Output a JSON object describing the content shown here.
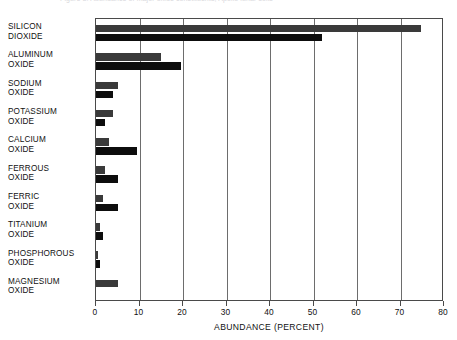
{
  "caption": {
    "text": "Figure 3. Abundance of major oxide constituents, Apollo lunar soils"
  },
  "chart_data": {
    "type": "bar",
    "orientation": "horizontal",
    "title": "",
    "xlabel": "ABUNDANCE (PERCENT)",
    "ylabel": "",
    "xlim": [
      0,
      80
    ],
    "xticks": [
      0,
      10,
      20,
      30,
      40,
      50,
      60,
      70,
      80
    ],
    "xtick_labels": [
      "0",
      "10",
      "20",
      "30",
      "40",
      "50",
      "60",
      "70",
      "80"
    ],
    "grid": true,
    "grid_axis": "x",
    "legend": "none",
    "categories": [
      "SILICON DIOXIDE",
      "ALUMINUM OXIDE",
      "SODIUM OXIDE",
      "POTASSIUM OXIDE",
      "CALCIUM OXIDE",
      "FERROUS OXIDE",
      "FERRIC OXIDE",
      "TITANIUM OXIDE",
      "PHOSPHOROUS OXIDE",
      "MAGNESIUM OXIDE"
    ],
    "category_lines": [
      [
        "SILICON",
        "DIOXIDE"
      ],
      [
        "ALUMINUM",
        "OXIDE"
      ],
      [
        "SODIUM",
        "OXIDE"
      ],
      [
        "POTASSIUM",
        "OXIDE"
      ],
      [
        "CALCIUM",
        "OXIDE"
      ],
      [
        "FERROUS",
        "OXIDE"
      ],
      [
        "FERRIC",
        "OXIDE"
      ],
      [
        "TITANIUM",
        "OXIDE"
      ],
      [
        "PHOSPHOROUS",
        "OXIDE"
      ],
      [
        "MAGNESIUM",
        "OXIDE"
      ]
    ],
    "series": [
      {
        "name": "upper",
        "color": "#3a3a3a",
        "values": [
          74.7,
          15.0,
          5.0,
          4.0,
          3.0,
          2.0,
          1.5,
          1.0,
          0.5,
          5.0
        ]
      },
      {
        "name": "lower",
        "color": "#0d0d0d",
        "values": [
          52.0,
          19.5,
          4.0,
          2.0,
          9.5,
          5.0,
          5.0,
          1.5,
          1.0,
          0.0
        ]
      }
    ]
  }
}
